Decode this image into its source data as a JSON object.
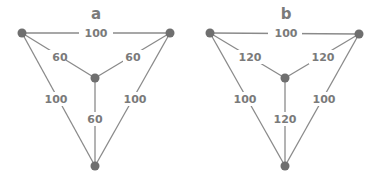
{
  "colors": {
    "edge": "#8a8a8a",
    "node": "#6f6f6f",
    "label": "#7a7a7a",
    "background": "#ffffff"
  },
  "graphs": [
    {
      "title": "a",
      "nodes": [
        {
          "id": "top-left",
          "x": 22,
          "y": 33
        },
        {
          "id": "top-right",
          "x": 170,
          "y": 33
        },
        {
          "id": "center",
          "x": 95,
          "y": 78
        },
        {
          "id": "bottom",
          "x": 95,
          "y": 166
        }
      ],
      "edges": [
        {
          "from": "top-left",
          "to": "top-right",
          "weight": "100"
        },
        {
          "from": "top-left",
          "to": "center",
          "weight": "60"
        },
        {
          "from": "top-right",
          "to": "center",
          "weight": "60"
        },
        {
          "from": "center",
          "to": "bottom",
          "weight": "60"
        },
        {
          "from": "top-left",
          "to": "bottom",
          "weight": "100"
        },
        {
          "from": "top-right",
          "to": "bottom",
          "weight": "100"
        }
      ]
    },
    {
      "title": "b",
      "nodes": [
        {
          "id": "top-left",
          "x": 210,
          "y": 33
        },
        {
          "id": "top-right",
          "x": 359,
          "y": 34
        },
        {
          "id": "center",
          "x": 285,
          "y": 78
        },
        {
          "id": "bottom",
          "x": 285,
          "y": 166
        }
      ],
      "edges": [
        {
          "from": "top-left",
          "to": "top-right",
          "weight": "100"
        },
        {
          "from": "top-left",
          "to": "center",
          "weight": "120"
        },
        {
          "from": "top-right",
          "to": "center",
          "weight": "120"
        },
        {
          "from": "center",
          "to": "bottom",
          "weight": "120"
        },
        {
          "from": "top-left",
          "to": "bottom",
          "weight": "100"
        },
        {
          "from": "top-right",
          "to": "bottom",
          "weight": "100"
        }
      ]
    }
  ]
}
